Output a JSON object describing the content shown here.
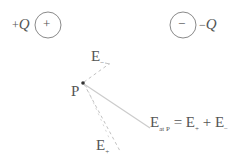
{
  "diagram": {
    "positive_charge": {
      "label_sign": "+",
      "label_var": "Q",
      "symbol": "+",
      "center": [
        48,
        25
      ],
      "radius": 13
    },
    "negative_charge": {
      "label_sign": "−",
      "label_var": "Q",
      "symbol": "−",
      "center": [
        183,
        25
      ],
      "radius": 13
    },
    "point": {
      "label": "P",
      "position": [
        83,
        83
      ]
    },
    "vectors": {
      "e_minus": {
        "base": "E",
        "subscript": "−",
        "style": "dashed",
        "to": [
          110,
          64
        ]
      },
      "e_plus": {
        "base": "E",
        "subscript": "+",
        "style": "dashed",
        "to": [
          121,
          152
        ]
      },
      "resultant": {
        "style": "solid",
        "to": [
          150,
          128
        ]
      }
    },
    "equation": {
      "lhs_base": "E",
      "lhs_subscript": "at P",
      "equals": "=",
      "term1_base": "E",
      "term1_subscript": "+",
      "plus": "+",
      "term2_base": "E",
      "term2_subscript": "−"
    },
    "colors": {
      "stroke": "#8a8a8a",
      "text": "#555555",
      "dashed": "#bdbdbd",
      "resultant": "#c8c8c8",
      "dot": "#333333"
    }
  }
}
